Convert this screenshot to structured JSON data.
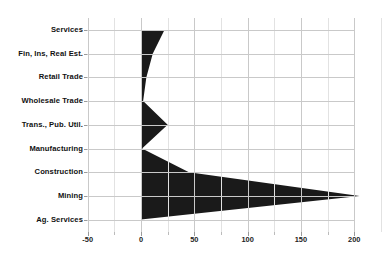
{
  "chart_data": {
    "type": "area",
    "title": "",
    "subtitle": "",
    "xlabel": "",
    "ylabel": "",
    "orientation": "horizontal",
    "grid": true,
    "legend": "none",
    "categories": [
      "Services",
      "Fin, Ins, Real Est.",
      "Retail Trade",
      "Wholesale Trade",
      "Trans., Pub. Util.",
      "Manufacturing",
      "Construction",
      "Mining",
      "Ag. Services"
    ],
    "values": [
      22,
      11,
      5,
      2,
      25,
      1,
      45,
      205,
      0
    ],
    "xticks": [
      -50,
      0,
      50,
      100,
      150,
      200
    ],
    "xticklabels": [
      "-50",
      "0",
      "50",
      "100",
      "150",
      "200"
    ],
    "xlim": [
      -50,
      205
    ],
    "ylim": [
      0,
      8
    ],
    "series": [
      {
        "name": "value",
        "values": [
          22,
          11,
          5,
          2,
          25,
          1,
          45,
          205,
          0
        ],
        "color": "#1a1a1a"
      }
    ],
    "colors": {
      "series": "#1a1a1a",
      "grid_major": "#c9c9c9",
      "grid_minor": "#e2e2e2",
      "tick": "#9a9a9a",
      "text": "#111111",
      "background": "#ffffff"
    }
  }
}
